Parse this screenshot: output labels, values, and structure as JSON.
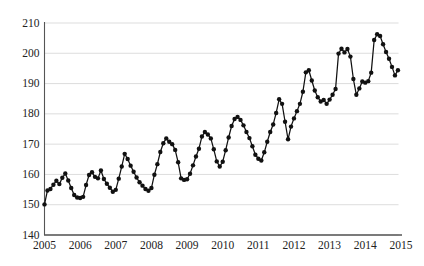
{
  "figure": {
    "background": "#ffffff",
    "width_px": 424,
    "height_px": 266
  },
  "chart_data": {
    "type": "line",
    "title": "",
    "xlabel": "",
    "ylabel": "",
    "legend": "none",
    "grid": "horizontal-light",
    "xlim": [
      2005,
      2015
    ],
    "ylim": [
      140,
      210
    ],
    "x_tick_labels": [
      "2005",
      "2006",
      "2007",
      "2008",
      "2009",
      "2010",
      "2011",
      "2012",
      "2013",
      "2014",
      "2015"
    ],
    "y_tick_labels": [
      "140",
      "150",
      "160",
      "170",
      "180",
      "190",
      "200",
      "210"
    ],
    "y_ticks": [
      140,
      150,
      160,
      170,
      180,
      190,
      200,
      210
    ],
    "series": [
      {
        "name": "monthly series",
        "frequency": "monthly",
        "start_year": 2005,
        "start_month": 1,
        "marker": "filled-circle",
        "values": [
          150.1,
          154.7,
          155.2,
          156.6,
          157.9,
          156.8,
          158.9,
          160.3,
          158.0,
          155.5,
          153.2,
          152.4,
          152.2,
          152.6,
          156.5,
          159.8,
          160.7,
          159.2,
          158.7,
          161.3,
          158.5,
          156.9,
          155.6,
          154.3,
          154.9,
          158.6,
          162.6,
          166.8,
          165.1,
          162.9,
          160.9,
          159.0,
          157.4,
          156.3,
          155.2,
          154.6,
          155.5,
          159.9,
          163.4,
          167.4,
          170.3,
          171.9,
          170.8,
          170.0,
          168.1,
          164.0,
          158.7,
          158.2,
          158.4,
          160.2,
          163.0,
          165.9,
          168.5,
          172.5,
          174.0,
          173.2,
          171.9,
          168.3,
          164.3,
          162.6,
          164.2,
          168.0,
          172.2,
          176.0,
          178.3,
          179.0,
          178.0,
          176.2,
          174.0,
          172.0,
          169.3,
          166.5,
          165.2,
          164.6,
          167.3,
          170.8,
          174.0,
          176.5,
          180.3,
          184.8,
          183.3,
          177.4,
          171.6,
          175.8,
          178.5,
          180.9,
          183.3,
          187.3,
          193.7,
          194.4,
          191.0,
          187.7,
          185.5,
          184.1,
          184.6,
          183.3,
          184.7,
          186.3,
          188.2,
          199.9,
          201.5,
          200.3,
          201.4,
          198.9,
          191.5,
          186.3,
          188.4,
          190.7,
          190.3,
          190.8,
          193.6,
          204.4,
          206.3,
          205.7,
          203.0,
          200.4,
          198.2,
          195.5,
          192.7,
          194.4
        ]
      }
    ],
    "colors": {
      "line": "#111111",
      "marker": "#111111",
      "grid": "#d9d9d9",
      "axis": "#555555",
      "tick_text": "#222222",
      "background": "#ffffff"
    }
  }
}
